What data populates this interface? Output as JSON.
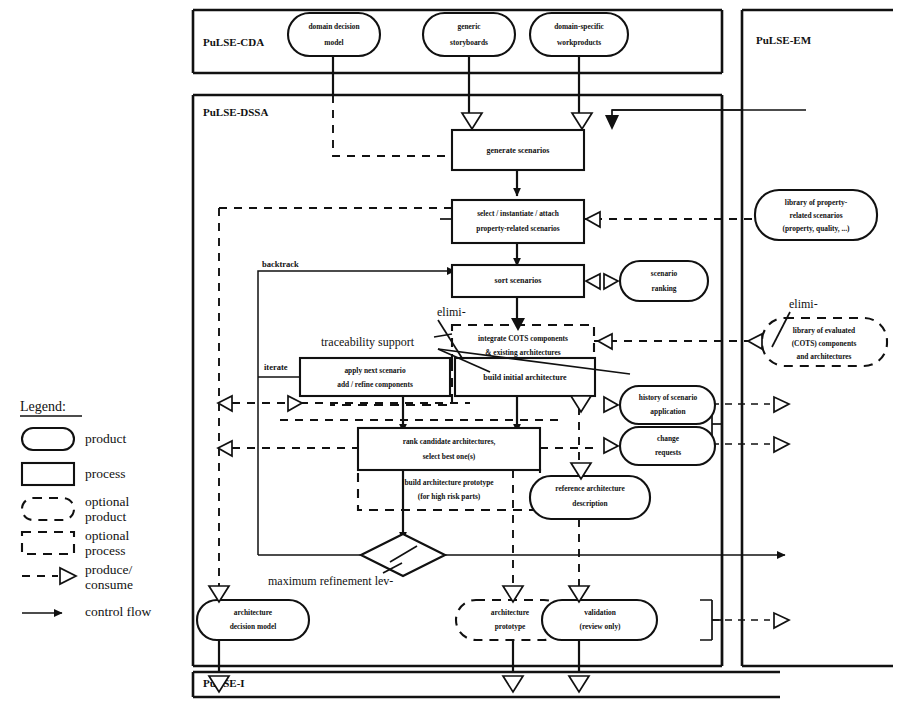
{
  "diagram": {
    "bands": [
      {
        "id": "cda",
        "label": "PuLSE-CDA"
      },
      {
        "id": "dssa",
        "label": "PuLSE-DSSA"
      },
      {
        "id": "i",
        "label": "PuLSE-I"
      },
      {
        "id": "em",
        "label": "PuLSE-EM"
      }
    ],
    "products": [
      {
        "id": "domain-decision-model",
        "lines": [
          "domain decision",
          "model"
        ]
      },
      {
        "id": "generic-storyboards",
        "lines": [
          "generic",
          "storyboards"
        ]
      },
      {
        "id": "domain-specific-workproducts",
        "lines": [
          "domain-specific",
          "workproducts"
        ]
      },
      {
        "id": "library-property-related-scenarios",
        "lines": [
          "library of property-",
          "related scenarios",
          "(property, quality, ...)"
        ]
      },
      {
        "id": "scenario-ranking",
        "lines": [
          "scenario",
          "ranking"
        ]
      },
      {
        "id": "history-of-scenario-application",
        "lines": [
          "history of scenario",
          "application"
        ]
      },
      {
        "id": "change-requests",
        "lines": [
          "change",
          "requests"
        ]
      },
      {
        "id": "reference-architecture-description",
        "lines": [
          "reference architecture",
          "description"
        ]
      },
      {
        "id": "architecture-decision-model",
        "lines": [
          "architecture",
          "decision model"
        ]
      },
      {
        "id": "validation",
        "lines": [
          "validation",
          "(review only)"
        ]
      }
    ],
    "optional_products": [
      {
        "id": "library-evaluated-cots",
        "lines": [
          "library of evaluated",
          "(COTS) components",
          "and architectures"
        ]
      },
      {
        "id": "architecture-prototype",
        "lines": [
          "architecture",
          "prototype"
        ]
      }
    ],
    "processes": [
      {
        "id": "generate-scenarios",
        "lines": [
          "generate scenarios"
        ]
      },
      {
        "id": "select-instantiate-attach",
        "lines": [
          "select / instantiate / attach",
          "property-related scenarios"
        ]
      },
      {
        "id": "sort-scenarios",
        "lines": [
          "sort scenarios"
        ]
      },
      {
        "id": "apply-next-scenario",
        "lines": [
          "apply next scenario",
          "add / refine components"
        ]
      },
      {
        "id": "build-initial-architecture",
        "lines": [
          "build initial architecture"
        ]
      },
      {
        "id": "rank-candidate-architectures",
        "lines": [
          "rank candidate architectures,",
          "select best one(s)"
        ]
      }
    ],
    "optional_processes": [
      {
        "id": "integrate-cots",
        "lines": [
          "integrate COTS components",
          "& existing architectures"
        ]
      },
      {
        "id": "build-architecture-prototype",
        "lines": [
          "build architecture prototype",
          "(for high risk parts)"
        ]
      }
    ],
    "annotations": [
      {
        "id": "backtrack",
        "text": "backtrack"
      },
      {
        "id": "iterate",
        "text": "iterate"
      },
      {
        "id": "traceability-support",
        "text": "traceability support"
      },
      {
        "id": "elimi-left",
        "text": "elimi-"
      },
      {
        "id": "elimi-right",
        "text": "elimi-"
      },
      {
        "id": "maximum-refinement-level",
        "text": "maximum refinement lev-"
      }
    ],
    "legend": {
      "title": "Legend:",
      "items": [
        {
          "id": "product",
          "label": "product",
          "symbol": "rounded-solid"
        },
        {
          "id": "process",
          "label": "process",
          "symbol": "rect-solid"
        },
        {
          "id": "optional-product",
          "label": "optional\nproduct",
          "line1": "optional",
          "line2": "product",
          "symbol": "rounded-dashed"
        },
        {
          "id": "optional-process",
          "label": "optional\nprocess",
          "line1": "optional",
          "line2": "process",
          "symbol": "rect-dashed"
        },
        {
          "id": "produce-consume",
          "label": "produce/\nconsume",
          "line1": "produce/",
          "line2": "consume",
          "symbol": "dashed-hollow-arrow"
        },
        {
          "id": "control-flow",
          "label": "control flow",
          "line1": "control flow",
          "line2": "",
          "symbol": "solid-filled-arrow"
        }
      ]
    }
  }
}
